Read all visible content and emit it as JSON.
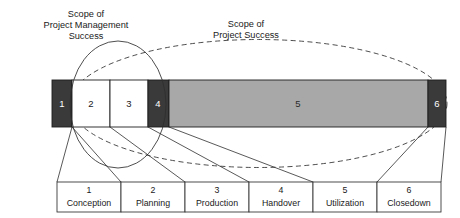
{
  "diagram": {
    "colors": {
      "dark_segment": "#3a3a3a",
      "light_segment": "#ffffff",
      "gray_segment": "#a8a8a8",
      "line": "#2e2e2e",
      "text": "#1a1a1a",
      "dark_segment_text": "#ffffff",
      "background": "#ffffff"
    },
    "annotations": [
      {
        "id": "scope-pm-success",
        "lines": [
          "Scope of",
          "Project Management",
          "Success"
        ],
        "style": "solid-ellipse"
      },
      {
        "id": "scope-project-success",
        "lines": [
          "Scope of",
          "Project Success"
        ],
        "style": "dashed-ellipse"
      }
    ],
    "bar": {
      "segments": [
        {
          "number": "1",
          "name": "Conception",
          "fill": "dark"
        },
        {
          "number": "2",
          "name": "Planning",
          "fill": "light"
        },
        {
          "number": "3",
          "name": "Production",
          "fill": "light"
        },
        {
          "number": "4",
          "name": "Handover",
          "fill": "dark"
        },
        {
          "number": "5",
          "name": "Utilization",
          "fill": "gray"
        },
        {
          "number": "6",
          "name": "Closedown",
          "fill": "dark"
        }
      ]
    },
    "legend": {
      "cells": [
        {
          "number": "1",
          "label": "Conception"
        },
        {
          "number": "2",
          "label": "Planning"
        },
        {
          "number": "3",
          "label": "Production"
        },
        {
          "number": "4",
          "label": "Handover"
        },
        {
          "number": "5",
          "label": "Utilization"
        },
        {
          "number": "6",
          "label": "Closedown"
        }
      ]
    }
  }
}
